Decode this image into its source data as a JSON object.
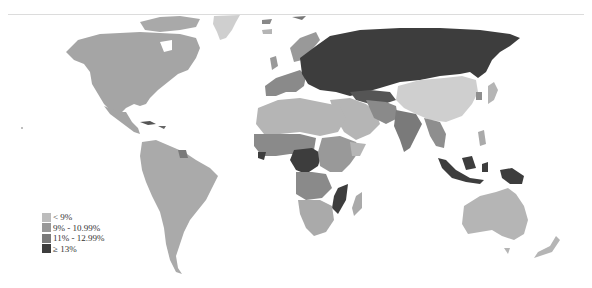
{
  "map": {
    "type": "choropleth",
    "region": "world",
    "colors": {
      "lt9": "#bcbcbc",
      "r9_11": "#989898",
      "r11_13": "#7a7a7a",
      "ge13": "#3d3d3d"
    }
  },
  "legend": {
    "items": [
      {
        "label": "< 9%",
        "color": "#bcbcbc"
      },
      {
        "label": "9% - 10.99%",
        "color": "#989898"
      },
      {
        "label": "11% - 12.99%",
        "color": "#7a7a7a"
      },
      {
        "label": "≥ 13%",
        "color": "#3d3d3d"
      }
    ]
  }
}
